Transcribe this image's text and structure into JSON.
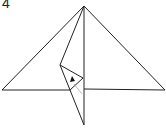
{
  "diagram": {
    "type": "origami-step",
    "step_label": "4",
    "colors": {
      "line": "#222222",
      "crease": "#aaaaaa",
      "arrow": "#111111"
    },
    "elements": [
      {
        "name": "outer-triangle",
        "description": "large folded triangle base"
      },
      {
        "name": "center-crease",
        "description": "vertical center line from apex to bottom tip"
      },
      {
        "name": "folded-flap",
        "description": "narrow flap folded down past the base"
      },
      {
        "name": "small-triangle",
        "description": "small inner triangle on the flap"
      },
      {
        "name": "fold-arrow",
        "description": "solid triangular arrowhead indicating fold"
      }
    ]
  }
}
